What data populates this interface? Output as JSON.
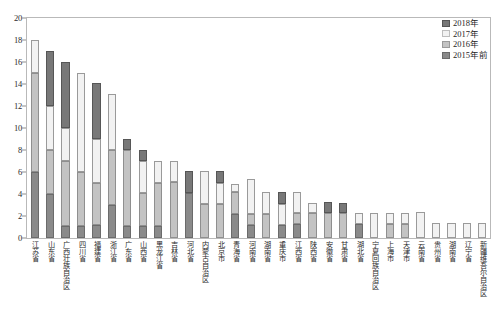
{
  "chart_data": {
    "type": "bar",
    "stacked": true,
    "title": "",
    "xlabel": "",
    "ylabel": "",
    "ylim": [
      0,
      20
    ],
    "ytick_step": 2,
    "yticks": [
      "0",
      "2",
      "4",
      "6",
      "8",
      "10",
      "12",
      "14",
      "16",
      "18",
      "20"
    ],
    "grid": false,
    "legend_position": "top-right",
    "legend": [
      "2018年",
      "2017年",
      "2016年",
      "2015年前"
    ],
    "series_colors": {
      "2018年": "#787878",
      "2017年": "#f2f2f2",
      "2016年": "#c3c3c3",
      "2015年前": "#8a8a8a"
    },
    "categories": [
      "江苏省",
      "山东省",
      "广西壮族自治区",
      "四川省",
      "福建省",
      "浙江省",
      "广东省",
      "山西省",
      "黑龙江省",
      "吉林省",
      "河北省",
      "内蒙古自治区",
      "北京市",
      "青海省",
      "河南省",
      "湖南省",
      "重庆市",
      "江西省",
      "陕西省",
      "安徽省",
      "甘肃省",
      "湖北省",
      "宁夏回族自治区",
      "上海市",
      "天津市",
      "云南省",
      "贵州省",
      "湖南省",
      "辽宁省",
      "新疆维吾尔自治区"
    ],
    "series": [
      {
        "name": "2015年前",
        "values": [
          6,
          4,
          1.1,
          1.1,
          1.2,
          3,
          1.1,
          1.1,
          1.1,
          0,
          4.1,
          0,
          0,
          2.2,
          1.2,
          0,
          1.2,
          1.3,
          0,
          0,
          0,
          1.3,
          0,
          0,
          0,
          0,
          0,
          0,
          0,
          0
        ]
      },
      {
        "name": "2016年",
        "values": [
          9,
          4,
          5.9,
          4.9,
          3.8,
          5,
          6.9,
          3,
          3.9,
          5.1,
          0,
          3.1,
          3.1,
          2,
          1,
          2.2,
          0,
          1,
          2.3,
          2.3,
          2.3,
          0,
          0,
          1.3,
          1.3,
          0,
          0,
          0,
          0,
          0
        ]
      },
      {
        "name": "2017年",
        "values": [
          3,
          4,
          3,
          9,
          4,
          5.1,
          0,
          2.9,
          2,
          1.9,
          0,
          3,
          1.9,
          0.7,
          3.2,
          2,
          1.9,
          1.9,
          0.9,
          0,
          0,
          1,
          2.3,
          1,
          1,
          2.4,
          1.4,
          1.4,
          1.4,
          1.4
        ]
      },
      {
        "name": "2018年",
        "values": [
          0,
          5,
          6,
          0,
          5.1,
          0,
          1,
          1,
          0,
          0,
          2,
          0,
          1.1,
          0,
          0,
          0,
          1.1,
          0,
          0,
          1,
          0.9,
          0,
          0,
          0,
          0,
          0,
          0,
          0,
          0,
          0
        ]
      }
    ],
    "totals": [
      18,
      17,
      16,
      15,
      14.1,
      13.1,
      9,
      8,
      7,
      7,
      6.1,
      6.1,
      6.1,
      5.1,
      5.1,
      4.2,
      4.2,
      3.2,
      3.2,
      3.3,
      3.2,
      2.3,
      2.3,
      2.3,
      2.3,
      2.4,
      1.4,
      1.4,
      1.4,
      1.4
    ]
  }
}
